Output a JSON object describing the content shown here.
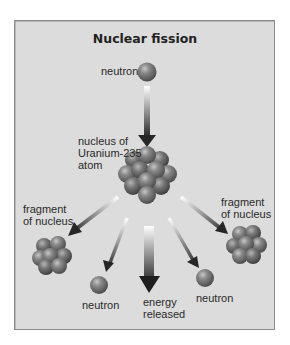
{
  "title": "Nuclear fission",
  "labels": {
    "incoming_neutron": "neutron",
    "nucleus_line1": "nucleus of",
    "nucleus_line2": "Uranium-235",
    "nucleus_line3": "atom",
    "fragment_left_line1": "fragment",
    "fragment_left_line2": "of nucleus",
    "fragment_right_line1": "fragment",
    "fragment_right_line2": "of nucleus",
    "neutron_left": "neutron",
    "energy_line1": "energy",
    "energy_line2": "released",
    "neutron_right": "neutron"
  },
  "colors": {
    "background": "#dcdcdc",
    "border": "#8a8a8a",
    "sphere": "#6e6e6e",
    "arrow": "#2a2a2a"
  }
}
